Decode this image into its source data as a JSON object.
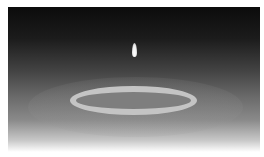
{
  "image": {
    "description": "Grayscale photo of a falling water droplet above an expanding ripple ring on a surface",
    "colors": {
      "top": "#0c0c0c",
      "middle": "#6a6a6a",
      "bottom": "#ffffff",
      "ring": "#c4c4c4",
      "ring_inner": "#7e7e7e",
      "droplet": "#ffffff"
    }
  }
}
